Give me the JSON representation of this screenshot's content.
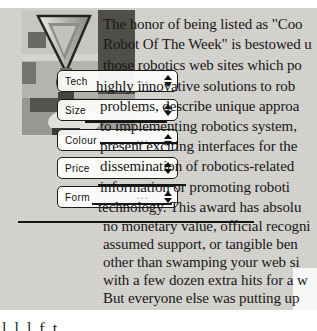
{
  "colors": {
    "page_bg": "#ffffff",
    "panel_bg": "#d4d2ce",
    "text": "#161616",
    "dropdown_bg": "#fcfcfb",
    "dropdown_border": "#1a1a1a",
    "strike": "#161616"
  },
  "photo": {
    "description": "grayscale photo of a parking-meter-like metal object in front of a building"
  },
  "dropdowns": [
    {
      "label": "Tech",
      "dots": "..."
    },
    {
      "label": "Size",
      "dots": "..."
    },
    {
      "label": "Colour",
      "dots": "..."
    },
    {
      "label": "Price",
      "dots": "..."
    },
    {
      "label": "Form",
      "dots": "..."
    }
  ],
  "paragraph": {
    "lines": [
      "The honor of being listed as \"Coo",
      "Robot Of The Week\" is bestowed u",
      "those robotics web sites which po",
      "highly innovative solutions to rob",
      "problems, describe unique approa",
      "to implementing robotics system,",
      "present exciting interfaces for the",
      "dissemination of robotics-related",
      "information or promoting roboti",
      "technology. This award has absolu",
      "no monetary value, official recogni",
      "assumed support, or tangible ben",
      "other than swamping your web si",
      "with a few dozen extra hits for a w",
      "But everyone else was putting up"
    ]
  },
  "footer": {
    "partial_glyphs": "l l l f t"
  }
}
